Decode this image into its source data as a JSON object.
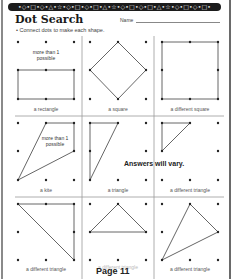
{
  "worksheet": {
    "header_band": "•◇•□•◇•△•☆•◇•□•◇•□•△•☆•◇•□•◇•□•△•☆•◇•□•◇•□•",
    "title": "Dot Search",
    "name_label": "Name",
    "instruction": "•  Connect dots to make each shape.",
    "answers_note": "Answers will vary.",
    "page_label": "Page 11",
    "colors": {
      "ink": "#222222",
      "band": "#1c1c1c",
      "line": "#666666",
      "divider": "#999999"
    }
  },
  "cells": [
    {
      "label": "a rectangle",
      "note": "more than 1 possible"
    },
    {
      "label": "a square",
      "note": ""
    },
    {
      "label": "a different square",
      "note": ""
    },
    {
      "label": "a kite",
      "note": "more than 1 possible"
    },
    {
      "label": "a triangle",
      "note": ""
    },
    {
      "label": "a different triangle",
      "note": ""
    },
    {
      "label": "a different triangle",
      "note": ""
    },
    {
      "label": "a different triangle",
      "note": ""
    },
    {
      "label": "a different triangle",
      "note": ""
    }
  ]
}
